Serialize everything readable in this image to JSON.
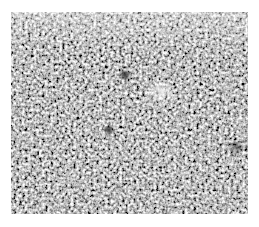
{
  "image": {
    "description": "Grayscale granular noise texture (micrograph-like) with white border",
    "colors": {
      "background": "#ffffff",
      "mid_gray": "#9a9a9a",
      "dark": "#2a2a2a",
      "light": "#f2f2f2"
    },
    "features": [
      {
        "type": "dark-spot",
        "x": 125,
        "y": 75
      },
      {
        "type": "light-patch",
        "x": 160,
        "y": 90
      }
    ]
  }
}
